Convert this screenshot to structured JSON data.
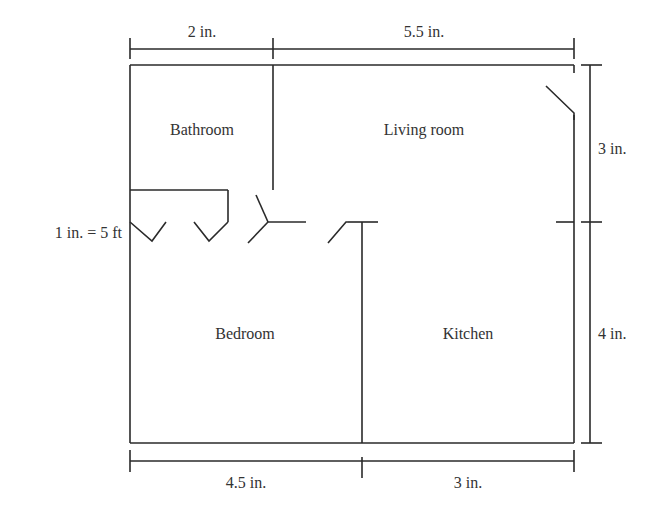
{
  "diagram": {
    "type": "floor-plan",
    "scale_label": "1 in. = 5 ft",
    "rooms": [
      {
        "name": "Bathroom"
      },
      {
        "name": "Living room"
      },
      {
        "name": "Bedroom"
      },
      {
        "name": "Kitchen"
      }
    ],
    "dimensions": {
      "top_left": "2 in.",
      "top_right": "5.5 in.",
      "right_top": "3 in.",
      "right_bottom": "4 in.",
      "bottom_left": "4.5 in.",
      "bottom_right": "3 in."
    },
    "colors": {
      "line": "#2a2a2a",
      "text": "#333333",
      "background": "#ffffff"
    }
  }
}
